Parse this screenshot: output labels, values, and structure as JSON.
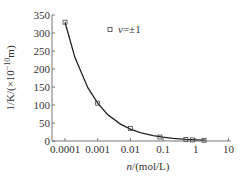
{
  "chart_data": {
    "type": "scatter",
    "title": "",
    "xlabel": "n/(mol/L)",
    "xlabel_italic": "n",
    "xlabel_rest": "/(mol/L)",
    "ylabel": "1/K/(×10^-10 m)",
    "xscale": "log",
    "xlim": [
      4e-05,
      12
    ],
    "ylim": [
      0,
      350
    ],
    "x_ticks": [
      0.0001,
      0.001,
      0.01,
      0.1,
      1,
      10
    ],
    "x_tick_labels": [
      "0.0001",
      "0.001",
      "0.01",
      "0.1",
      "1",
      "10"
    ],
    "y_ticks": [
      0,
      50,
      100,
      150,
      200,
      250,
      300,
      350
    ],
    "y_tick_labels": [
      "0",
      "50",
      "100",
      "150",
      "200",
      "250",
      "300",
      "350"
    ],
    "grid": false,
    "legend_position": "upper right",
    "series": [
      {
        "name": "ν=±1",
        "marker": "open-square",
        "x": [
          0.0001,
          0.001,
          0.01,
          0.08,
          0.5,
          0.8,
          1.8
        ],
        "values": [
          330,
          105,
          35,
          11,
          4,
          3,
          2
        ]
      },
      {
        "name": "fit curve",
        "style": "solid-line",
        "x": [
          0.0001,
          0.0002,
          0.0005,
          0.001,
          0.002,
          0.005,
          0.01,
          0.02,
          0.05,
          0.1,
          0.2,
          0.5,
          1,
          2
        ],
        "values": [
          330,
          233,
          148,
          105,
          74,
          47,
          33,
          23,
          15,
          10.5,
          7.4,
          4.7,
          3.3,
          2.3
        ]
      }
    ]
  },
  "legend": {
    "symbol": "ν",
    "rest": "=±1"
  },
  "axes": {
    "y_label_main": "1/K/(×10",
    "y_label_sup": "−10",
    "y_label_end": "m)",
    "x_label_italic": "n",
    "x_label_rest": "/(mol/L)"
  }
}
